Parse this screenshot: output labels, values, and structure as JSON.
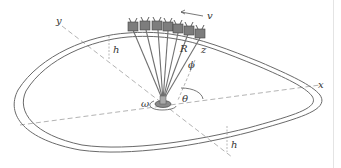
{
  "figure": {
    "labels": {
      "y_axis": "y",
      "x_axis": "x",
      "z_axis": "z",
      "height_top": "h",
      "height_bottom": "h",
      "radius": "R",
      "phi": "ϕ",
      "theta": "θ",
      "omega": "ω",
      "velocity": "v"
    },
    "colors": {
      "line": "#6a6a6a",
      "dashed": "#9a9a9a",
      "car": "#7d7d7d"
    },
    "car_count": 7
  }
}
